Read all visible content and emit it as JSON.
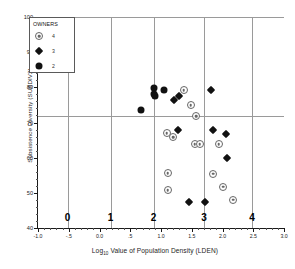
{
  "chart_data": {
    "type": "scatter",
    "title": "",
    "xlabel": "Log10 Value of Population Density (LDEN)",
    "xlabel_main": "Value of Population Density (LDEN)",
    "xlabel_prefix": "Log",
    "xlabel_sub": "10",
    "ylabel": "Subsistence Diversity (SUBDIV2)",
    "xlim": [
      -1.0,
      3.0
    ],
    "ylim": [
      40,
      100
    ],
    "grid": true,
    "legend_position": "top-left",
    "xticks": [
      -1.0,
      -0.5,
      0.0,
      0.5,
      1.0,
      1.5,
      2.0,
      2.5,
      3.0
    ],
    "xticklabels": [
      "-1.0",
      "-.5",
      "0.0",
      ".5",
      "1.0",
      "1.5",
      "2.0",
      "2.5",
      "3.0"
    ],
    "xminorticks": [
      -0.9,
      -0.8,
      -0.7,
      -0.6,
      -0.4,
      -0.3,
      -0.2,
      -0.1,
      0.1,
      0.2,
      0.3,
      0.4,
      0.6,
      0.7,
      0.8,
      0.9,
      1.1,
      1.2,
      1.3,
      1.4,
      1.6,
      1.7,
      1.8,
      1.9,
      2.1,
      2.2,
      2.3,
      2.4,
      2.6,
      2.7,
      2.8,
      2.9
    ],
    "yticks": [
      40,
      50,
      60,
      70,
      80,
      90,
      100
    ],
    "yticklabels": [
      "40",
      "50",
      "60",
      "70",
      "80",
      "90",
      "100"
    ],
    "yminorticks": [
      42,
      44,
      46,
      48,
      52,
      54,
      56,
      58,
      62,
      64,
      66,
      68,
      72,
      74,
      76,
      78,
      82,
      84,
      86,
      88,
      92,
      94,
      96,
      98
    ],
    "vertical_gridlines": [
      -0.52,
      0.18,
      0.88,
      1.7,
      2.48
    ],
    "horizontal_gridlines": [
      71.8
    ],
    "category_labels": [
      {
        "text": "0",
        "x": -0.52
      },
      {
        "text": "1",
        "x": 0.18
      },
      {
        "text": "2",
        "x": 0.88
      },
      {
        "text": "3",
        "x": 1.7
      },
      {
        "text": "4",
        "x": 2.48
      }
    ],
    "legend": {
      "title": "OWNERS",
      "entries": [
        {
          "label": "4",
          "marker": "target-circle-icon",
          "color": "#666666"
        },
        {
          "label": "3",
          "marker": "filled-diamond-icon",
          "color": "#111111"
        },
        {
          "label": "2",
          "marker": "filled-circle-icon",
          "color": "#111111"
        }
      ]
    },
    "series": [
      {
        "name": "2",
        "marker": "filled-circle-icon",
        "color": "#111111",
        "points": [
          {
            "x": 0.68,
            "y": 73.5
          },
          {
            "x": 0.88,
            "y": 79.8
          },
          {
            "x": 0.89,
            "y": 78.2
          },
          {
            "x": 0.9,
            "y": 77.4
          },
          {
            "x": 1.05,
            "y": 79.1
          }
        ]
      },
      {
        "name": "3",
        "marker": "filled-diamond-icon",
        "color": "#111111",
        "points": [
          {
            "x": 1.21,
            "y": 76.3
          },
          {
            "x": 1.3,
            "y": 77.5
          },
          {
            "x": 1.82,
            "y": 79.2
          },
          {
            "x": 1.27,
            "y": 67.9
          },
          {
            "x": 1.85,
            "y": 67.8
          },
          {
            "x": 2.06,
            "y": 66.8
          },
          {
            "x": 2.07,
            "y": 59.8
          },
          {
            "x": 1.46,
            "y": 47.4
          },
          {
            "x": 1.72,
            "y": 47.4
          }
        ]
      },
      {
        "name": "4",
        "marker": "target-circle-icon",
        "color": "#666666",
        "points": [
          {
            "x": 1.37,
            "y": 79.1
          },
          {
            "x": 1.48,
            "y": 74.9
          },
          {
            "x": 1.57,
            "y": 71.8
          },
          {
            "x": 1.09,
            "y": 66.9
          },
          {
            "x": 1.2,
            "y": 65.9
          },
          {
            "x": 1.55,
            "y": 63.8
          },
          {
            "x": 1.63,
            "y": 63.9
          },
          {
            "x": 1.94,
            "y": 63.9
          },
          {
            "x": 1.11,
            "y": 55.6
          },
          {
            "x": 1.85,
            "y": 55.4
          },
          {
            "x": 1.11,
            "y": 50.8
          },
          {
            "x": 2.01,
            "y": 51.8
          },
          {
            "x": 2.17,
            "y": 48.1
          }
        ]
      }
    ]
  }
}
